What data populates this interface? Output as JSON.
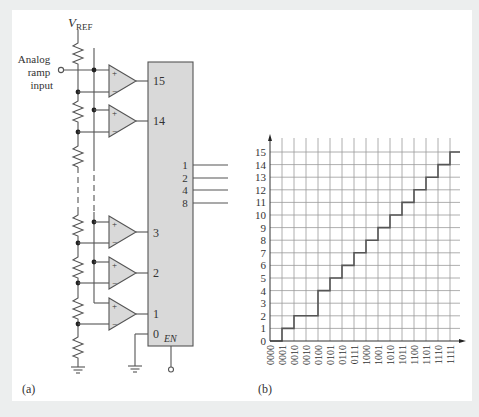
{
  "figure": {
    "panel_a": {
      "label": "(a)",
      "vref_label": "V",
      "vref_subscript": "REF",
      "input_label_lines": [
        "Analog",
        "ramp",
        "input"
      ],
      "comparators": [
        {
          "output_pin": "15"
        },
        {
          "output_pin": "14"
        },
        {
          "output_pin": "3"
        },
        {
          "output_pin": "2"
        },
        {
          "output_pin": "1"
        }
      ],
      "comparator_plus": "+",
      "comparator_minus": "−",
      "encoder_input_zero": "0",
      "encoder_enable": "EN",
      "encoder_outputs": [
        "1",
        "2",
        "4",
        "8"
      ]
    },
    "panel_b": {
      "label": "(b)"
    },
    "colors": {
      "block_fill": "#d9d9d9",
      "line": "#555555",
      "grid": "#9a9a9a",
      "step": "#555555"
    }
  },
  "chart_data": {
    "type": "line",
    "subtype": "step",
    "title": "",
    "xlabel": "",
    "ylabel": "",
    "categories": [
      "0000",
      "0001",
      "0010",
      "0010",
      "0100",
      "0101",
      "0110",
      "0111",
      "1000",
      "1001",
      "1010",
      "1011",
      "1100",
      "1101",
      "1110",
      "1111"
    ],
    "values": [
      0,
      1,
      2,
      2,
      4,
      5,
      6,
      7,
      8,
      9,
      10,
      11,
      12,
      13,
      14,
      15
    ],
    "y_ticks": [
      0,
      1,
      2,
      3,
      4,
      5,
      6,
      7,
      8,
      9,
      10,
      11,
      12,
      13,
      14,
      15
    ],
    "ylim": [
      0,
      15
    ],
    "grid": true,
    "legend": null
  }
}
